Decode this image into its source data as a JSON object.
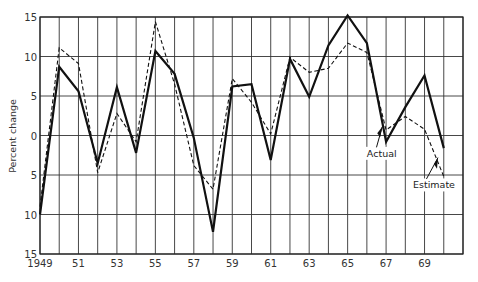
{
  "chart_data": {
    "type": "line",
    "title": "",
    "xlabel": "",
    "ylabel": "Percent change",
    "ylim": [
      -15,
      15
    ],
    "xlim": [
      1949,
      1971
    ],
    "grid": true,
    "y_ticks": [
      15,
      10,
      5,
      0,
      -5,
      -10,
      -15
    ],
    "y_tick_labels": [
      "15",
      "10",
      "5",
      "0",
      "5",
      "10",
      "15"
    ],
    "x_tick_labels": [
      "1949",
      "51",
      "53",
      "55",
      "57",
      "59",
      "61",
      "63",
      "65",
      "67",
      "69"
    ],
    "x_tick_years": [
      1949,
      1951,
      1953,
      1955,
      1957,
      1959,
      1961,
      1963,
      1965,
      1967,
      1969
    ],
    "x": [
      1949,
      1950,
      1951,
      1952,
      1953,
      1954,
      1955,
      1956,
      1957,
      1958,
      1959,
      1960,
      1961,
      1962,
      1963,
      1964,
      1965,
      1966,
      1967,
      1968,
      1969,
      1970
    ],
    "series": [
      {
        "name": "Actual",
        "style": "solid",
        "values": [
          -10,
          8.7,
          5.6,
          -3.5,
          6.1,
          -2.2,
          10.7,
          7.8,
          -0.3,
          -12.2,
          6.2,
          6.5,
          -3.1,
          9.7,
          4.9,
          11.4,
          15.2,
          11.7,
          -0.8,
          3.6,
          7.6,
          -1.6
        ]
      },
      {
        "name": "Estimate",
        "style": "dashed",
        "values": [
          -9,
          11.1,
          9.1,
          -4.7,
          2.8,
          -0.8,
          14.4,
          6.5,
          -3.8,
          -6.8,
          7.2,
          4.2,
          0.2,
          9.9,
          8,
          8.5,
          11.7,
          10.5,
          0.7,
          2.4,
          0.8,
          -5.2
        ]
      }
    ],
    "annotations": [
      {
        "text": "Actual",
        "points_to_year": 1966.8
      },
      {
        "text": "Estimate",
        "points_to_year": 1969.7
      }
    ]
  }
}
